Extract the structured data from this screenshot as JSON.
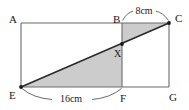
{
  "figure": {
    "type": "geometry-diagram",
    "background_color": "#ffffff",
    "line_color": "#555555",
    "diagonal_color": "#2b2b2b",
    "shade_color": "#cccccc",
    "text_color": "#1a1a1a",
    "vertices": [
      {
        "id": "A",
        "label": "A",
        "x": 21,
        "y": 23
      },
      {
        "id": "B",
        "label": "B",
        "x": 122,
        "y": 23
      },
      {
        "id": "C",
        "label": "C",
        "x": 169,
        "y": 23
      },
      {
        "id": "E",
        "label": "E",
        "x": 21,
        "y": 87
      },
      {
        "id": "F",
        "label": "F",
        "x": 122,
        "y": 87
      },
      {
        "id": "G",
        "label": "G",
        "x": 169,
        "y": 87
      },
      {
        "id": "X",
        "label": "X",
        "x": 122,
        "y": 44
      }
    ],
    "vertex_label_positions": [
      {
        "id": "A",
        "label": "A",
        "x": 9,
        "y": 23
      },
      {
        "id": "B",
        "label": "B",
        "x": 113,
        "y": 23
      },
      {
        "id": "C",
        "label": "C",
        "x": 175,
        "y": 22
      },
      {
        "id": "E",
        "label": "E",
        "x": 9,
        "y": 99
      },
      {
        "id": "F",
        "label": "F",
        "x": 120,
        "y": 102
      },
      {
        "id": "G",
        "label": "G",
        "x": 169,
        "y": 101
      },
      {
        "id": "X",
        "label": "X",
        "x": 114,
        "y": 57
      }
    ],
    "dimensions": [
      {
        "id": "top-dimension",
        "label": "8cm",
        "value": 8,
        "unit": "cm",
        "from": "B",
        "to": "C",
        "label_x": 144,
        "label_y": 13
      },
      {
        "id": "bottom-dimension",
        "label": "16cm",
        "value": 16,
        "unit": "cm",
        "from": "E",
        "to": "F",
        "label_x": 71,
        "label_y": 101
      }
    ],
    "shaded_regions": [
      {
        "id": "upper-triangle",
        "points": "122,23 169,23 122,44"
      },
      {
        "id": "lower-triangle",
        "points": "21,87 122,87 122,44"
      }
    ],
    "marked_points": [
      {
        "id": "E-dot",
        "x": 21,
        "y": 87
      },
      {
        "id": "C-dot",
        "x": 169,
        "y": 23
      },
      {
        "id": "X-dot",
        "x": 122,
        "y": 44
      }
    ]
  }
}
